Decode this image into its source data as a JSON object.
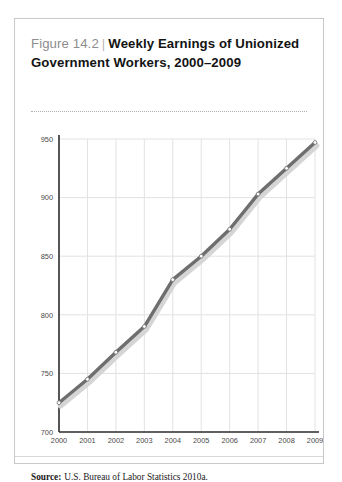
{
  "figure": {
    "number": "Figure 14.2",
    "separator": "|",
    "name": "Weekly Earnings of Unionized Government Workers, 2000–2009",
    "source_label": "Source:",
    "source_text": "U.S. Bureau of Labor Statistics 2010a."
  },
  "chart_data": {
    "type": "line",
    "title": "Weekly Earnings of Unionized Government Workers, 2000–2009",
    "xlabel": "",
    "ylabel": "",
    "categories": [
      "2000",
      "2001",
      "2002",
      "2003",
      "2004",
      "2005",
      "2006",
      "2007",
      "2008",
      "2009"
    ],
    "x": [
      2000,
      2001,
      2002,
      2003,
      2004,
      2005,
      2006,
      2007,
      2008,
      2009
    ],
    "values": [
      725,
      745,
      768,
      790,
      830,
      850,
      873,
      903,
      925,
      947
    ],
    "series": [
      {
        "name": "Weekly earnings",
        "values": [
          725,
          745,
          768,
          790,
          830,
          850,
          873,
          903,
          925,
          947
        ]
      }
    ],
    "ylim": [
      700,
      950
    ],
    "yticks": [
      700,
      750,
      800,
      850,
      900,
      950
    ],
    "ytick_labels": [
      "700",
      "750",
      "800",
      "850",
      "900",
      "950"
    ],
    "xticks": [
      2000,
      2001,
      2002,
      2003,
      2004,
      2005,
      2006,
      2007,
      2008,
      2009
    ],
    "xtick_labels": [
      "2000",
      "2001",
      "2002",
      "2003",
      "2004",
      "2005",
      "2006",
      "2007",
      "2008",
      "2009"
    ],
    "grid": true,
    "legend": false,
    "legend_position": "none",
    "line_color": "#6e6e6e",
    "marker_color": "#ffffff",
    "marker_edge_color": "#6e6e6e",
    "shadow_color": "#d5d5d5",
    "grid_color": "#e2e2e2",
    "axis_color": "#2b2b2b"
  }
}
